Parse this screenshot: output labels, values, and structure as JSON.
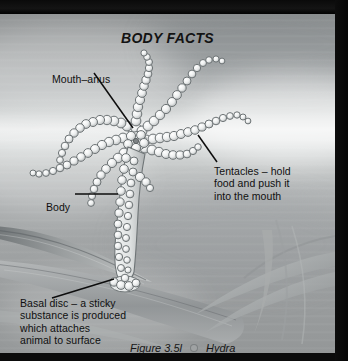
{
  "figure": {
    "title": "BODY FACTS",
    "caption_number": "Figure 3.5l",
    "caption_subject": "Hydra",
    "separator_icon": "bullet-dot"
  },
  "labels": {
    "mouth_anus": "Mouth–anus",
    "body": "Body",
    "tentacles": "Tentacles – hold\nfood and push it\ninto the mouth",
    "basal_disc": "Basal disc – a sticky\nsubstance is produced\nwhich attaches\nanimal to surface"
  },
  "colors": {
    "frame": "#070707",
    "water_light": "#eff0f0",
    "water_mid": "#a8abac",
    "water_dark": "#8e9192",
    "leader_line": "#0d0d0d",
    "text": "#101010",
    "caption_dot": "#9fa2a3",
    "organism_outline": "#6e7476",
    "organism_fill": "#e9ebeb",
    "leaf_dark": "#6f7476",
    "leaf_light": "#b9bcbd"
  },
  "scene": {
    "subject": "hydra",
    "tentacle_count": 7,
    "substrate": "aquatic-plant-leaves"
  }
}
